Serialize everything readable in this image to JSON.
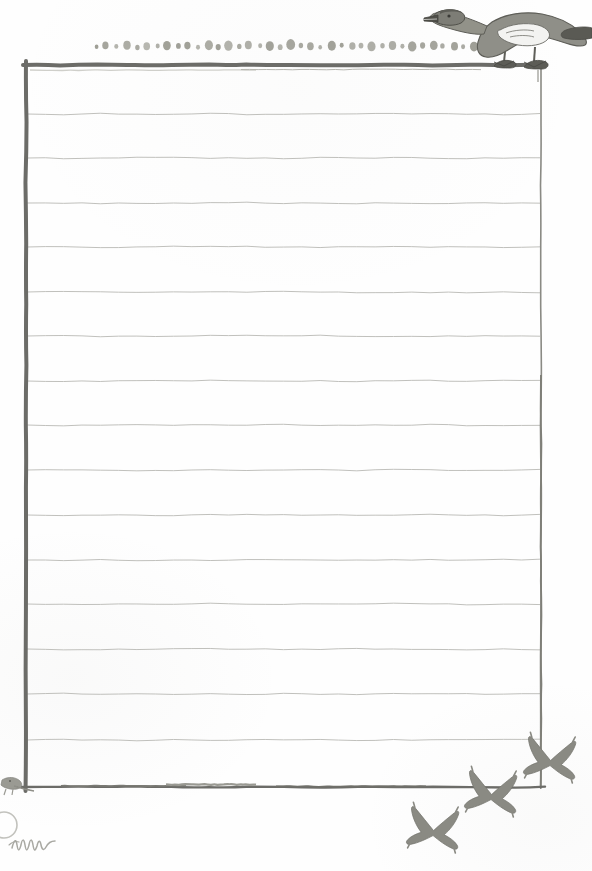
{
  "page": {
    "kind": "hand-drawn-lined-notepaper",
    "width": 592,
    "height": 871,
    "background_color": "#fefefe",
    "caption": ""
  },
  "colors": {
    "border_dark": "#6c6c68",
    "border_mid": "#8a8a84",
    "rule_line": "#b9b9b4",
    "dot": "#9b9b92",
    "bird_fill": "#8d8d86",
    "bird_outline": "#6d6d66",
    "signature": "#a8a8a2"
  },
  "frame": {
    "left_x": 26,
    "right_x": 541,
    "top_y": 65,
    "bottom_y": 787,
    "top_border_weight": 4,
    "left_border_weight": 4,
    "right_border_weight": 1.6,
    "bottom_border_weight": 2.4,
    "style": "hand-drawn ink rule"
  },
  "ruled_lines": {
    "count": 16,
    "spacing_px": 45,
    "first_y": 114,
    "y_positions": [
      114,
      158,
      203,
      247,
      292,
      336,
      381,
      425,
      470,
      515,
      560,
      604,
      649,
      694,
      740,
      786
    ],
    "stroke_color": "#b9b9b4",
    "stroke_width": 0.9,
    "style": "slightly wavy hand-drawn"
  },
  "dot_band": {
    "label": "decorative dot border",
    "y": 46,
    "x_start": 96,
    "x_end": 474,
    "count": 38,
    "color": "#9b9b92",
    "shape": "irregular oval/berry",
    "radii": [
      2.0,
      3.4,
      2.2,
      4.0,
      2.4,
      3.6,
      2.2,
      4.2,
      2.6,
      3.4,
      2.2,
      4.4,
      2.8,
      4.6,
      2.4,
      3.8,
      2.2,
      4.4,
      2.6,
      4.8,
      2.4,
      3.6,
      2.0,
      4.4,
      2.2,
      3.4,
      2.6,
      4.4,
      2.4,
      4.0,
      2.2,
      4.6,
      2.8,
      4.2,
      2.4,
      3.8,
      2.2,
      4.4
    ]
  },
  "illustrations": [
    {
      "name": "perched-goose",
      "description": "goose / waterbird standing on the top border rule, head and beak pointing left, long neck, folded wing, tail to the right, webbed feet gripping the line",
      "position": {
        "x": 424,
        "y": 2,
        "width": 168,
        "height": 68
      },
      "fill": "#8d8d86",
      "outline": "#5e5e58"
    },
    {
      "name": "flying-bird-upper",
      "description": "swallow silhouette in flight, wings swept, descending left",
      "position": {
        "x": 527,
        "y": 736,
        "width": 52,
        "height": 46
      },
      "fill": "#8a8a83"
    },
    {
      "name": "flying-bird-middle",
      "description": "swallow silhouette in flight crossing the bottom border",
      "position": {
        "x": 468,
        "y": 770,
        "width": 52,
        "height": 46
      },
      "fill": "#8a8a83"
    },
    {
      "name": "flying-bird-lower",
      "description": "swallow silhouette in flight, lowest of the trio",
      "position": {
        "x": 410,
        "y": 806,
        "width": 52,
        "height": 46
      },
      "fill": "#8a8a83"
    },
    {
      "name": "corner-bird-mark",
      "description": "small faint bird mark perched at the bottom-left frame corner",
      "position": {
        "x": 2,
        "y": 776,
        "width": 30,
        "height": 22
      },
      "fill": "#9a9a93"
    }
  ],
  "marks": [
    {
      "name": "signature-squiggle",
      "description": "faint handwritten squiggle / signature in the bottom-left margin",
      "position": {
        "x": 10,
        "y": 836,
        "width": 50,
        "height": 18
      },
      "color": "#a8a8a2"
    },
    {
      "name": "faint-circle-smudge",
      "description": "faint partial circular smudge at far bottom-left edge",
      "position": {
        "x": -6,
        "y": 812,
        "width": 26,
        "height": 26
      },
      "color": "#bdbdb8"
    }
  ]
}
